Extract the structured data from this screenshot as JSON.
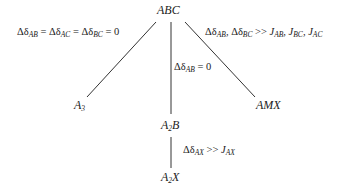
{
  "diagram": {
    "type": "tree",
    "nodes": {
      "root": {
        "base": "ABC"
      },
      "left": {
        "base": "A",
        "sub": "3"
      },
      "middle": {
        "base": "A",
        "sub": "2",
        "tail": "B"
      },
      "right": {
        "base": "AMX"
      },
      "bottom": {
        "base": "A",
        "sub": "2",
        "tail": "X"
      }
    },
    "conditions": {
      "left": {
        "d": "Δδ",
        "s1": "AB",
        "eq1": " = Δδ",
        "s2": "AC",
        "eq2": " = Δδ",
        "s3": "BC",
        "end": " = 0"
      },
      "right": {
        "d": "Δδ",
        "s1": "AB",
        "c1": ", Δδ",
        "s2": "BC",
        "gg": " >> ",
        "j1": "J",
        "js1": "AB",
        "c2": ", ",
        "j2": "J",
        "js2": "BC",
        "c3": ", ",
        "j3": "J",
        "js3": "AC"
      },
      "middle": {
        "d": "Δδ",
        "s1": "AB",
        "end": " = 0"
      },
      "bottom": {
        "d": "Δδ",
        "s1": "AX",
        "gg": " >> ",
        "j1": "J",
        "js1": "AX"
      }
    },
    "edges": [
      {
        "from": "ABC",
        "to": "A3",
        "label": "Δδ_AB = Δδ_AC = Δδ_BC = 0"
      },
      {
        "from": "ABC",
        "to": "A2B",
        "label": "Δδ_AB = 0"
      },
      {
        "from": "ABC",
        "to": "AMX",
        "label": "Δδ_AB, Δδ_BC >> J_AB, J_BC, J_AC"
      },
      {
        "from": "A2B",
        "to": "A2X",
        "label": "Δδ_AX >> J_AX"
      }
    ]
  }
}
